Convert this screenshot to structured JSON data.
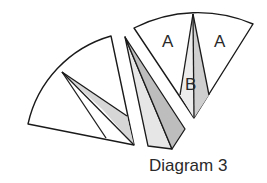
{
  "caption": "Diagram 3",
  "labels": {
    "a_left": "A",
    "a_right": "A",
    "b": "B"
  },
  "colors": {
    "stroke": "#1a1a1a",
    "white": "#ffffff",
    "light_gray": "#e6e6e6",
    "mid_gray": "#cfcfcf",
    "dark_gray": "#b9b9b9"
  },
  "pieces": [
    {
      "name": "left-sector",
      "description": "Sector with two thin triangles drawn from a point on the arc to the center, one shaded"
    },
    {
      "name": "middle-sliver",
      "description": "Cut-out thin sliver split into a light and a darker triangle"
    },
    {
      "name": "right-sector",
      "description": "Sector divided into two white regions labeled A and a central shaded region labeled B"
    }
  ]
}
